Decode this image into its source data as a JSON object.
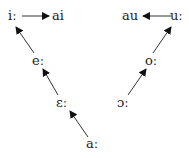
{
  "left_diagram": {
    "nodes": {
      "i": "iː",
      "ai": "ai",
      "e": "eː",
      "eps": "ɛː",
      "a": "aː"
    },
    "arrows": [
      {
        "from": "iː",
        "to": "ai"
      },
      {
        "from": "eː",
        "to": "iː"
      },
      {
        "from": "ɛː",
        "to": "eː"
      },
      {
        "from": "aː",
        "to": "ɛː"
      }
    ]
  },
  "right_diagram": {
    "nodes": {
      "au": "au",
      "u": "uː",
      "o": "oː",
      "oo": "ɔː"
    },
    "arrows": [
      {
        "from": "uː",
        "to": "au"
      },
      {
        "from": "oː",
        "to": "uː"
      },
      {
        "from": "ɔː",
        "to": "oː"
      }
    ]
  }
}
